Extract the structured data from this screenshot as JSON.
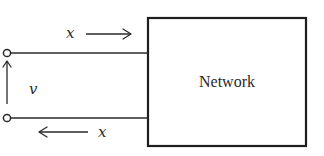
{
  "diagram": {
    "type": "two-terminal network (one-port) schematic",
    "block": {
      "label": "Network"
    },
    "port": {
      "terminal_count": 2,
      "terminal_style": "open circle"
    },
    "voltage": {
      "label": "v",
      "direction": "up (bottom terminal to top terminal)"
    },
    "currents": [
      {
        "id": "top",
        "label": "x",
        "direction": "right (into network, along top wire)"
      },
      {
        "id": "bottom",
        "label": "x",
        "direction": "left (out of network, along bottom wire)"
      }
    ],
    "colors": {
      "line": "#2a2a2a",
      "background": "#ffffff"
    }
  }
}
